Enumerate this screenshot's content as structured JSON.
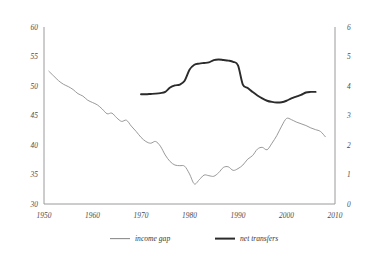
{
  "chart_data": {
    "type": "line",
    "title": "",
    "subtitle": "",
    "xlabel": "",
    "ylabel": "",
    "y2label": "",
    "grid": false,
    "legend_position": "bottom",
    "x": [
      1950,
      2010
    ],
    "xlim": [
      1950,
      2010
    ],
    "xticks": [
      1950,
      1960,
      1970,
      1980,
      1990,
      2000,
      2010
    ],
    "xticklabels": [
      "1950",
      "1960",
      "1970",
      "1980",
      "1990",
      "2000",
      "2010"
    ],
    "ylim": [
      30,
      60
    ],
    "yticks": [
      30,
      35,
      40,
      45,
      50,
      55,
      60
    ],
    "yticklabels": [
      "30",
      "35",
      "40",
      "45",
      "50",
      "55",
      "60"
    ],
    "y2lim": [
      0,
      6
    ],
    "y2ticks": [
      0,
      1,
      2,
      3,
      4,
      5,
      6
    ],
    "y2ticklabels": [
      "0",
      "1",
      "2",
      "3",
      "4",
      "5",
      "6"
    ],
    "series": [
      {
        "name": "income gap",
        "axis": "left",
        "color": "#8d8d8d",
        "style": "thin-line",
        "x": [
          1951,
          1952,
          1953,
          1954,
          1955,
          1956,
          1957,
          1958,
          1959,
          1960,
          1961,
          1962,
          1963,
          1964,
          1965,
          1966,
          1967,
          1968,
          1969,
          1970,
          1971,
          1972,
          1973,
          1974,
          1975,
          1976,
          1977,
          1978,
          1979,
          1980,
          1981,
          1982,
          1983,
          1984,
          1985,
          1986,
          1987,
          1988,
          1989,
          1990,
          1991,
          1992,
          1993,
          1994,
          1995,
          1996,
          1997,
          1998,
          1999,
          2000,
          2001,
          2002,
          2003,
          2004,
          2005,
          2006,
          2007,
          2008
        ],
        "values": [
          52.5,
          51.7,
          50.9,
          50.3,
          49.9,
          49.4,
          48.7,
          48.3,
          47.6,
          47.2,
          46.8,
          46.1,
          45.3,
          45.4,
          44.6,
          44.0,
          44.2,
          43.2,
          42.3,
          41.3,
          40.6,
          40.3,
          40.6,
          39.8,
          38.3,
          37.2,
          36.6,
          36.5,
          36.4,
          35.1,
          33.4,
          34.1,
          34.9,
          34.8,
          34.7,
          35.3,
          36.2,
          36.3,
          35.7,
          36.0,
          36.6,
          37.6,
          38.2,
          39.3,
          39.6,
          39.2,
          40.3,
          41.6,
          43.2,
          44.5,
          44.3,
          43.9,
          43.6,
          43.3,
          42.9,
          42.6,
          42.3,
          41.4
        ]
      },
      {
        "name": "net transfers",
        "axis": "right",
        "color": "#2b2b2b",
        "style": "thick-line",
        "x": [
          1970,
          1971,
          1972,
          1973,
          1974,
          1975,
          1976,
          1977,
          1978,
          1979,
          1980,
          1981,
          1982,
          1983,
          1984,
          1985,
          1986,
          1987,
          1988,
          1989,
          1990,
          1991,
          1992,
          1993,
          1994,
          1995,
          1996,
          1997,
          1998,
          1999,
          2000,
          2001,
          2002,
          2003,
          2004,
          2005,
          2006
        ],
        "values": [
          3.72,
          3.72,
          3.73,
          3.74,
          3.76,
          3.8,
          3.95,
          4.02,
          4.05,
          4.18,
          4.55,
          4.72,
          4.76,
          4.78,
          4.8,
          4.88,
          4.9,
          4.88,
          4.86,
          4.82,
          4.7,
          4.05,
          3.93,
          3.8,
          3.68,
          3.58,
          3.5,
          3.46,
          3.44,
          3.45,
          3.5,
          3.58,
          3.64,
          3.7,
          3.78,
          3.8,
          3.8
        ]
      }
    ],
    "legend": [
      {
        "label": "income gap",
        "color": "#8d8d8d",
        "style": "thin-line"
      },
      {
        "label": "net transfers",
        "color": "#2b2b2b",
        "style": "thick-line"
      }
    ]
  }
}
